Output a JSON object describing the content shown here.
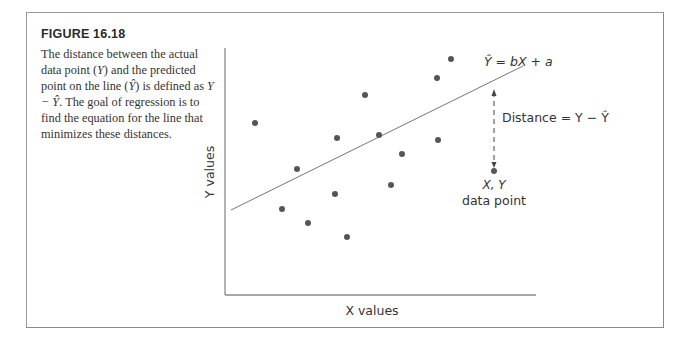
{
  "figure": {
    "title": "FIGURE 16.18",
    "caption_parts": [
      "The distance between the actual data point (",
      "Y",
      ") and the predicted point on the line (",
      "Ŷ",
      ") is defined as ",
      "Y − Ŷ",
      ". The goal of regression is to find the equation for the line that minimizes these distances."
    ]
  },
  "diagram": {
    "x_axis_label": "X values",
    "y_axis_label": "Y values",
    "line_equation": "Ŷ = bX + a",
    "distance_label": "Distance = Y − Ŷ",
    "point_label_line1": "X, Y",
    "point_label_line2": "data point",
    "colors": {
      "axis": "#8a8a8a",
      "point": "#555555",
      "line": "#777777"
    }
  },
  "chart_data": {
    "type": "scatter",
    "title": "",
    "xlabel": "X values",
    "ylabel": "Y values",
    "grid": false,
    "points_px": [
      [
        255,
        123
      ],
      [
        282,
        209
      ],
      [
        297,
        169
      ],
      [
        308,
        223
      ],
      [
        335,
        194
      ],
      [
        337,
        138
      ],
      [
        347,
        237
      ],
      [
        365,
        95
      ],
      [
        379,
        135
      ],
      [
        391,
        185
      ],
      [
        402,
        154
      ],
      [
        437,
        78
      ],
      [
        438,
        140
      ],
      [
        451,
        59
      ],
      [
        494,
        171
      ]
    ],
    "regression_line_px": {
      "x1": 231,
      "y1": 210,
      "x2": 523,
      "y2": 66
    },
    "highlighted_point_px": [
      494,
      171
    ],
    "distance_segment_px": {
      "x": 494,
      "y_top": 89,
      "y_bottom": 168
    }
  }
}
